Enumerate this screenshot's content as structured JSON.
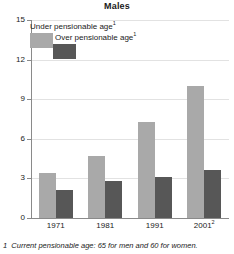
{
  "chart_data": {
    "type": "bar",
    "title": "Males",
    "xlabel": "",
    "ylabel": "",
    "categories": [
      "1971",
      "1981",
      "1991",
      "2001"
    ],
    "category_labels_raw": [
      "1971",
      "1981",
      "1991",
      "2001²"
    ],
    "category_superscripts": [
      "",
      "",
      "",
      "2"
    ],
    "series": [
      {
        "name": "Under pensionable age",
        "name_superscript": "1",
        "color": "#a9a9a9",
        "values": [
          3.4,
          4.7,
          7.3,
          10.0
        ]
      },
      {
        "name": "Over pensionable age",
        "name_superscript": "1",
        "color": "#575757",
        "values": [
          2.1,
          2.8,
          3.1,
          3.65
        ]
      }
    ],
    "ylim": [
      0,
      15
    ],
    "yticks": [
      0,
      3,
      6,
      9,
      12,
      15
    ],
    "ytick_labels": [
      "0",
      "3",
      "6",
      "9",
      "12",
      "15"
    ],
    "grid": true,
    "grid_axis": "y",
    "legend_position": "top-left"
  },
  "legend": {
    "items": [
      {
        "label": "Under pensionable age",
        "superscript": "1",
        "swatch": "light"
      },
      {
        "label": "Over pensionable age",
        "superscript": "1",
        "swatch": "dark"
      }
    ]
  },
  "footnote": {
    "marker": "1",
    "text": "Current pensionable age: 65 for men and 60 for women.",
    "full": "1  Current pensionable age: 65 for men and 60 for women."
  },
  "colors": {
    "light_bar": "#a9a9a9",
    "dark_bar": "#575757",
    "axis": "#8a8a8a",
    "grid": "#e2e2e2",
    "text": "#1a1a1a",
    "background": "#ffffff"
  }
}
